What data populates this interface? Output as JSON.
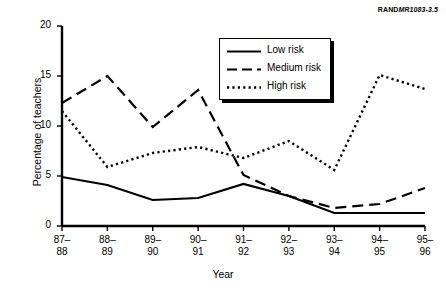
{
  "credit": {
    "brand": "RAND",
    "doc_id": "MR1083-3.5"
  },
  "chart_data": {
    "type": "line",
    "title": "",
    "xlabel": "Year",
    "ylabel": "Percentage of teachers",
    "categories": [
      "87-88",
      "88-89",
      "89-90",
      "90-91",
      "91-92",
      "92-93",
      "93-94",
      "94-95",
      "95-96"
    ],
    "category_lines": [
      [
        "87–",
        "88"
      ],
      [
        "88–",
        "89"
      ],
      [
        "89–",
        "90"
      ],
      [
        "90–",
        "91"
      ],
      [
        "91–",
        "92"
      ],
      [
        "92–",
        "93"
      ],
      [
        "93–",
        "94"
      ],
      [
        "94–",
        "95"
      ],
      [
        "95–",
        "96"
      ]
    ],
    "ylim": [
      0,
      20
    ],
    "yticks": [
      0,
      5,
      10,
      15,
      20
    ],
    "ytick_labels": [
      "0",
      "5",
      "10",
      "15",
      "20"
    ],
    "grid": false,
    "legend_position": "top-center-right",
    "series": [
      {
        "name": "Low risk",
        "style": "solid",
        "color": "#000000",
        "values": [
          4.9,
          4.1,
          2.6,
          2.8,
          4.2,
          3.0,
          1.3,
          1.3,
          1.3
        ]
      },
      {
        "name": "Medium risk",
        "style": "dashed",
        "color": "#000000",
        "values": [
          12.3,
          15.0,
          9.9,
          13.6,
          5.1,
          3.0,
          1.8,
          2.2,
          3.8
        ]
      },
      {
        "name": "High risk",
        "style": "dotted",
        "color": "#000000",
        "values": [
          11.5,
          5.9,
          7.3,
          7.9,
          6.8,
          8.5,
          5.6,
          15.1,
          13.7
        ]
      }
    ]
  }
}
